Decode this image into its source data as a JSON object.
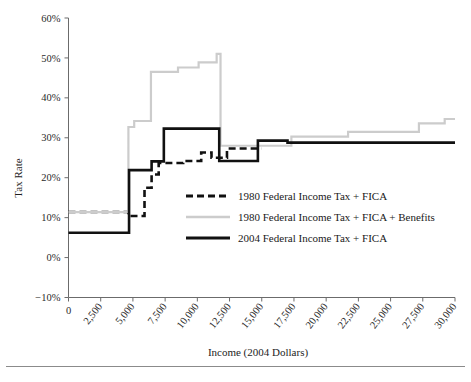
{
  "chart_data": {
    "type": "line",
    "title": "",
    "xlabel": "Income (2004 Dollars)",
    "ylabel": "Tax Rate",
    "xlim": [
      0,
      30000
    ],
    "ylim": [
      -10,
      60
    ],
    "grid": false,
    "legend_position": "center",
    "x_ticks": [
      0,
      2500,
      5000,
      7500,
      10000,
      12500,
      15000,
      17500,
      20000,
      22500,
      25000,
      27500,
      30000
    ],
    "x_tick_labels": [
      "0",
      "2,500",
      "5,000",
      "7,500",
      "10,000",
      "12,500",
      "15,000",
      "17,500",
      "20,000",
      "22,500",
      "25,000",
      "27,500",
      "30,000"
    ],
    "y_ticks": [
      -10,
      0,
      10,
      20,
      30,
      40,
      50,
      60
    ],
    "y_tick_labels": [
      "−10%",
      "0%",
      "10%",
      "20%",
      "30%",
      "40%",
      "50%",
      "60%"
    ],
    "series": [
      {
        "name": "1980 Federal Income Tax + FICA",
        "style": "dashed",
        "color": "#111111",
        "width": 2.6,
        "points": [
          [
            0,
            11.4
          ],
          [
            4650,
            11.4
          ],
          [
            4650,
            10.4
          ],
          [
            5900,
            10.4
          ],
          [
            5900,
            17.5
          ],
          [
            6450,
            17.5
          ],
          [
            6450,
            20.8
          ],
          [
            7000,
            20.8
          ],
          [
            7000,
            23.7
          ],
          [
            8900,
            23.7
          ],
          [
            8900,
            24.2
          ],
          [
            10300,
            24.2
          ],
          [
            10300,
            26.3
          ],
          [
            11100,
            26.3
          ],
          [
            11100,
            25.0
          ],
          [
            12300,
            25.0
          ],
          [
            12300,
            27.3
          ],
          [
            15000,
            27.3
          ]
        ]
      },
      {
        "name": "1980 Federal Income Tax + FICA + Benefits",
        "style": "solid",
        "color": "#cccccc",
        "width": 2.2,
        "points": [
          [
            0,
            11.4
          ],
          [
            4650,
            11.4
          ],
          [
            4650,
            32.7
          ],
          [
            5100,
            32.7
          ],
          [
            5100,
            34.2
          ],
          [
            6400,
            34.2
          ],
          [
            6400,
            46.5
          ],
          [
            8500,
            46.5
          ],
          [
            8500,
            47.6
          ],
          [
            10100,
            47.6
          ],
          [
            10100,
            48.9
          ],
          [
            11500,
            48.9
          ],
          [
            11500,
            51.0
          ],
          [
            11800,
            51.0
          ],
          [
            11800,
            28.0
          ],
          [
            17300,
            28.0
          ],
          [
            17300,
            30.3
          ],
          [
            21700,
            30.3
          ],
          [
            21700,
            31.5
          ],
          [
            27200,
            31.5
          ],
          [
            27200,
            33.6
          ],
          [
            29200,
            33.6
          ],
          [
            29200,
            34.7
          ],
          [
            30000,
            34.7
          ]
        ]
      },
      {
        "name": "2004 Federal Income Tax + FICA",
        "style": "solid",
        "color": "#111111",
        "width": 2.6,
        "points": [
          [
            0,
            6.2
          ],
          [
            4700,
            6.2
          ],
          [
            4700,
            21.9
          ],
          [
            6450,
            21.9
          ],
          [
            6450,
            24.1
          ],
          [
            7400,
            24.1
          ],
          [
            7400,
            32.3
          ],
          [
            11700,
            32.3
          ],
          [
            11700,
            24.2
          ],
          [
            14700,
            24.2
          ],
          [
            14700,
            29.3
          ],
          [
            17000,
            29.3
          ],
          [
            17000,
            28.8
          ],
          [
            30000,
            28.8
          ]
        ]
      }
    ]
  },
  "legend": {
    "items": [
      {
        "label": "1980 Federal Income Tax + FICA",
        "swatch": "dashed-black"
      },
      {
        "label": "1980 Federal Income Tax + FICA + Benefits",
        "swatch": "solid-gray"
      },
      {
        "label": "2004 Federal Income Tax + FICA",
        "swatch": "solid-black"
      }
    ]
  },
  "colors": {
    "series_1980": "#111111",
    "series_1980_benefits": "#cccccc",
    "series_2004": "#111111",
    "axis": "#6b6b6b"
  }
}
